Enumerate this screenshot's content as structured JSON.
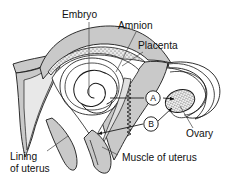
{
  "figure": {
    "type": "anatomical-cross-section",
    "background_color": "#ffffff",
    "line_color": "#1a1a1a",
    "muscle_fill": "#c9c9c9",
    "lining_fill": "#e8e8e8",
    "placenta_fill": "#d6d6d6",
    "ovary_fill": "#ededed",
    "cavity_fill": "#ffffff"
  },
  "labels": {
    "embryo": "Embryo",
    "amnion": "Amnion",
    "placenta": "Placenta",
    "ovary": "Ovary",
    "lining_line1": "Lining",
    "lining_line2": "of uterus",
    "muscle": "Muscle of uterus"
  },
  "markers": [
    {
      "id": "A",
      "text": "A"
    },
    {
      "id": "B",
      "text": "B"
    }
  ]
}
